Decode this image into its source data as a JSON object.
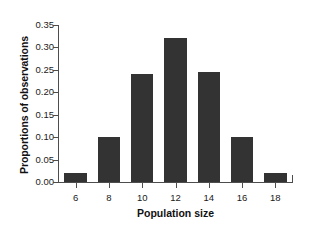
{
  "chart_data": {
    "type": "bar",
    "title": "",
    "xlabel": "Population size",
    "ylabel": "Proportions of observations",
    "categories": [
      "6",
      "8",
      "10",
      "12",
      "14",
      "16",
      "18"
    ],
    "values": [
      0.02,
      0.1,
      0.24,
      0.32,
      0.245,
      0.1,
      0.02
    ],
    "xlim": [
      5,
      19
    ],
    "ylim": [
      0.0,
      0.35
    ],
    "y_ticks": [
      "0.00",
      "0.05",
      "0.10",
      "0.15",
      "0.20",
      "0.25",
      "0.30",
      "0.35"
    ],
    "y_tick_values": [
      0.0,
      0.05,
      0.1,
      0.15,
      0.2,
      0.25,
      0.3,
      0.35
    ],
    "x_ticks": [
      "6",
      "8",
      "10",
      "12",
      "14",
      "16",
      "18"
    ],
    "x_tick_values": [
      6,
      8,
      10,
      12,
      14,
      16,
      18
    ],
    "grid": false,
    "legend": false,
    "bar_color": "#333333",
    "axis_color": "#4d4d4d",
    "background": "#ffffff"
  }
}
